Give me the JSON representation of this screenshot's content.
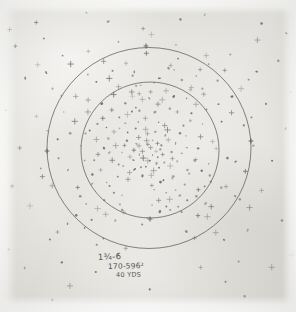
{
  "sheet": {
    "title": "Shot Pattern Target Sheet",
    "paper_color": "#e6e5e0",
    "ink_color": "#5a5853",
    "mark_color": "#55524d",
    "border_color": "#fcfcfb"
  },
  "annotation": {
    "line1": "1¾-6",
    "line2": "170-596²",
    "line3": "40 YDS"
  },
  "chart_data": {
    "type": "scatter",
    "subtitle": "1¾-6 / 170-596² / 40 YDS",
    "xlabel": "",
    "ylabel": "",
    "grid": false,
    "legend": false,
    "xlim": [
      0,
      296
    ],
    "ylim": [
      0,
      312
    ],
    "rings": [
      {
        "name": "outer-ring",
        "cx": 149,
        "cy": 148,
        "r": 102,
        "stroke": "#55534e",
        "width": 0.9
      },
      {
        "name": "inner-ring",
        "cx": 150,
        "cy": 150,
        "r": 69,
        "stroke": "#55534e",
        "width": 0.9
      }
    ],
    "ticks": [
      {
        "name": "tick-outer-left",
        "x": 47,
        "y": 151
      },
      {
        "name": "tick-outer-right",
        "x": 251,
        "y": 141
      },
      {
        "name": "tick-inner-bottom",
        "x": 150,
        "y": 219
      },
      {
        "name": "tick-outer-top",
        "x": 146,
        "y": 46
      }
    ],
    "marks": [
      [
        150,
        147
      ],
      [
        143,
        152
      ],
      [
        157,
        143
      ],
      [
        136,
        144
      ],
      [
        163,
        155
      ],
      [
        148,
        161
      ],
      [
        155,
        132
      ],
      [
        130,
        157
      ],
      [
        168,
        140
      ],
      [
        141,
        168
      ],
      [
        159,
        167
      ],
      [
        127,
        140
      ],
      [
        172,
        152
      ],
      [
        145,
        130
      ],
      [
        134,
        170
      ],
      [
        165,
        126
      ],
      [
        122,
        152
      ],
      [
        177,
        161
      ],
      [
        151,
        176
      ],
      [
        138,
        122
      ],
      [
        180,
        134
      ],
      [
        119,
        128
      ],
      [
        160,
        182
      ],
      [
        128,
        180
      ],
      [
        186,
        147
      ],
      [
        112,
        160
      ],
      [
        155,
        112
      ],
      [
        140,
        110
      ],
      [
        190,
        120
      ],
      [
        108,
        138
      ],
      [
        172,
        178
      ],
      [
        118,
        176
      ],
      [
        196,
        160
      ],
      [
        102,
        118
      ],
      [
        162,
        100
      ],
      [
        132,
        96
      ],
      [
        200,
        136
      ],
      [
        98,
        155
      ],
      [
        176,
        190
      ],
      [
        114,
        192
      ],
      [
        206,
        110
      ],
      [
        92,
        175
      ],
      [
        150,
        92
      ],
      [
        186,
        98
      ],
      [
        88,
        100
      ],
      [
        210,
        175
      ],
      [
        104,
        200
      ],
      [
        152,
        205
      ],
      [
        196,
        196
      ],
      [
        80,
        146
      ],
      [
        216,
        148
      ],
      [
        140,
        86
      ],
      [
        170,
        210
      ],
      [
        118,
        86
      ],
      [
        124,
        212
      ],
      [
        74,
        122
      ],
      [
        222,
        122
      ],
      [
        202,
        88
      ],
      [
        86,
        204
      ],
      [
        182,
        80
      ],
      [
        96,
        82
      ],
      [
        226,
        186
      ],
      [
        68,
        170
      ],
      [
        148,
        218
      ],
      [
        212,
        206
      ],
      [
        76,
        216
      ],
      [
        160,
        78
      ],
      [
        112,
        70
      ],
      [
        232,
        96
      ],
      [
        62,
        96
      ],
      [
        200,
        70
      ],
      [
        92,
        220
      ],
      [
        236,
        162
      ],
      [
        58,
        140
      ],
      [
        134,
        72
      ],
      [
        218,
        80
      ],
      [
        70,
        64
      ],
      [
        240,
        200
      ],
      [
        104,
        238
      ],
      [
        170,
        66
      ],
      [
        244,
        126
      ],
      [
        52,
        186
      ],
      [
        186,
        232
      ],
      [
        126,
        248
      ],
      [
        216,
        232
      ],
      [
        58,
        232
      ],
      [
        248,
        80
      ],
      [
        46,
        72
      ],
      [
        248,
        230
      ],
      [
        40,
        168
      ],
      [
        146,
        54
      ],
      [
        206,
        56
      ],
      [
        88,
        52
      ],
      [
        254,
        146
      ],
      [
        36,
        116
      ],
      [
        230,
        54
      ],
      [
        262,
        190
      ],
      [
        30,
        206
      ],
      [
        176,
        44
      ],
      [
        118,
        42
      ],
      [
        266,
        104
      ],
      [
        26,
        78
      ],
      [
        258,
        40
      ],
      [
        44,
        38
      ],
      [
        272,
        160
      ],
      [
        20,
        148
      ],
      [
        152,
        34
      ],
      [
        238,
        262
      ],
      [
        62,
        262
      ],
      [
        278,
        60
      ],
      [
        16,
        46
      ],
      [
        282,
        220
      ],
      [
        200,
        268
      ],
      [
        96,
        272
      ],
      [
        144,
        28
      ],
      [
        272,
        268
      ],
      [
        24,
        268
      ],
      [
        286,
        128
      ],
      [
        12,
        186
      ],
      [
        262,
        24
      ],
      [
        36,
        22
      ],
      [
        180,
        20
      ],
      [
        108,
        22
      ],
      [
        286,
        34
      ],
      [
        10,
        30
      ],
      [
        226,
        282
      ],
      [
        70,
        286
      ],
      [
        150,
        290
      ],
      [
        292,
        256
      ],
      [
        8,
        250
      ],
      [
        204,
        14
      ],
      [
        86,
        12
      ],
      [
        290,
        92
      ],
      [
        6,
        110
      ],
      [
        244,
        296
      ],
      [
        52,
        300
      ],
      [
        146,
        140
      ],
      [
        153,
        155
      ],
      [
        139,
        146
      ],
      [
        161,
        149
      ],
      [
        147,
        134
      ],
      [
        156,
        164
      ],
      [
        133,
        160
      ],
      [
        166,
        136
      ],
      [
        128,
        132
      ],
      [
        170,
        166
      ],
      [
        142,
        176
      ],
      [
        158,
        122
      ],
      [
        124,
        166
      ],
      [
        176,
        144
      ],
      [
        152,
        186
      ],
      [
        132,
        112
      ],
      [
        184,
        126
      ],
      [
        116,
        146
      ],
      [
        166,
        192
      ],
      [
        122,
        196
      ],
      [
        190,
        174
      ],
      [
        106,
        128
      ],
      [
        158,
        104
      ],
      [
        142,
        100
      ],
      [
        198,
        148
      ],
      [
        100,
        170
      ],
      [
        178,
        112
      ],
      [
        126,
        104
      ],
      [
        202,
        124
      ],
      [
        96,
        140
      ],
      [
        170,
        200
      ],
      [
        110,
        186
      ],
      [
        208,
        164
      ],
      [
        88,
        112
      ],
      [
        166,
        90
      ],
      [
        136,
        86
      ],
      [
        212,
        142
      ],
      [
        84,
        160
      ],
      [
        184,
        184
      ],
      [
        120,
        204
      ],
      [
        218,
        104
      ],
      [
        78,
        188
      ],
      [
        154,
        82
      ],
      [
        192,
        88
      ],
      [
        76,
        96
      ],
      [
        222,
        188
      ],
      [
        98,
        208
      ],
      [
        160,
        212
      ],
      [
        204,
        186
      ],
      [
        70,
        134
      ],
      [
        228,
        158
      ],
      [
        132,
        76
      ],
      [
        178,
        206
      ],
      [
        110,
        78
      ],
      [
        116,
        220
      ],
      [
        64,
        112
      ],
      [
        232,
        112
      ],
      [
        196,
        76
      ],
      [
        80,
        196
      ],
      [
        174,
        70
      ],
      [
        88,
        74
      ],
      [
        236,
        196
      ],
      [
        58,
        158
      ],
      [
        142,
        224
      ],
      [
        208,
        216
      ],
      [
        68,
        224
      ],
      [
        168,
        68
      ],
      [
        104,
        62
      ],
      [
        242,
        88
      ],
      [
        52,
        88
      ],
      [
        208,
        64
      ],
      [
        84,
        228
      ],
      [
        246,
        172
      ],
      [
        48,
        130
      ],
      [
        126,
        64
      ],
      [
        224,
        70
      ],
      [
        62,
        56
      ],
      [
        250,
        208
      ],
      [
        96,
        244
      ],
      [
        178,
        58
      ],
      [
        252,
        118
      ],
      [
        42,
        176
      ],
      [
        194,
        238
      ],
      [
        118,
        254
      ],
      [
        224,
        240
      ],
      [
        50,
        240
      ],
      [
        256,
        72
      ],
      [
        38,
        64
      ],
      [
        150,
        160
      ],
      [
        144,
        158
      ],
      [
        156,
        152
      ],
      [
        148,
        144
      ],
      [
        152,
        140
      ],
      [
        146,
        166
      ],
      [
        158,
        158
      ],
      [
        138,
        138
      ],
      [
        162,
        146
      ],
      [
        140,
        154
      ],
      [
        154,
        170
      ],
      [
        134,
        150
      ],
      [
        164,
        162
      ],
      [
        136,
        128
      ],
      [
        168,
        130
      ],
      [
        130,
        172
      ],
      [
        172,
        158
      ],
      [
        126,
        124
      ],
      [
        174,
        176
      ],
      [
        124,
        146
      ],
      [
        182,
        154
      ],
      [
        118,
        164
      ],
      [
        186,
        136
      ],
      [
        114,
        132
      ],
      [
        188,
        170
      ],
      [
        110,
        152
      ],
      [
        192,
        114
      ],
      [
        106,
        182
      ],
      [
        194,
        160
      ],
      [
        102,
        104
      ],
      [
        198,
        190
      ],
      [
        98,
        124
      ],
      [
        146,
        118
      ],
      [
        154,
        190
      ],
      [
        136,
        108
      ],
      [
        164,
        180
      ],
      [
        128,
        114
      ],
      [
        170,
        108
      ],
      [
        120,
        118
      ],
      [
        180,
        196
      ],
      [
        112,
        110
      ],
      [
        188,
        200
      ],
      [
        104,
        148
      ],
      [
        196,
        104
      ],
      [
        94,
        160
      ],
      [
        202,
        170
      ],
      [
        90,
        130
      ],
      [
        206,
        204
      ],
      [
        150,
        98
      ],
      [
        158,
        200
      ],
      [
        140,
        94
      ],
      [
        166,
        206
      ],
      [
        132,
        92
      ],
      [
        174,
        96
      ],
      [
        122,
        210
      ],
      [
        182,
        212
      ],
      [
        114,
        94
      ],
      [
        190,
        90
      ],
      [
        106,
        214
      ],
      [
        198,
        216
      ],
      [
        92,
        184
      ],
      [
        204,
        94
      ],
      [
        86,
        134
      ],
      [
        210,
        182
      ]
    ]
  }
}
